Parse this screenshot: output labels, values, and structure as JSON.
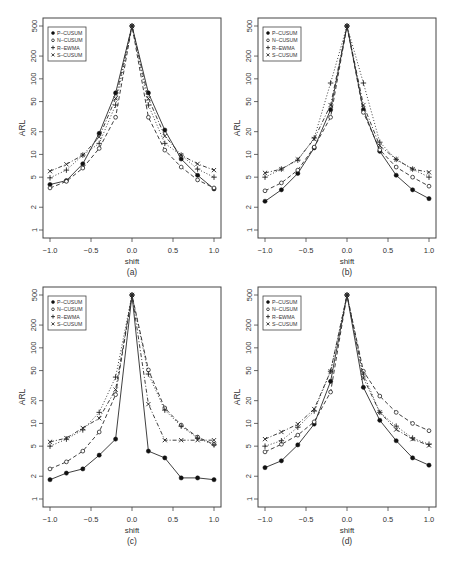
{
  "figure": {
    "x_ticks": [
      "-1.0",
      "-0.5",
      "0.0",
      "0.5",
      "1.0"
    ],
    "y_ticks": [
      "1",
      "2",
      "5",
      "10",
      "20",
      "50",
      "100",
      "200",
      "500"
    ],
    "xlabel": "shift",
    "ylabel": "ARL"
  },
  "legend": [
    {
      "name": "P-CUSUM",
      "marker": "filled-circle",
      "line": "solid"
    },
    {
      "name": "N-CUSUM",
      "marker": "open-circle",
      "line": "dashed"
    },
    {
      "name": "R-EWMA",
      "marker": "plus",
      "line": "dotted"
    },
    {
      "name": "S-CUSUM",
      "marker": "cross",
      "line": "dotdash"
    }
  ],
  "chart_data": [
    {
      "type": "line",
      "panel": "(a)",
      "xlabel": "shift",
      "ylabel": "ARL",
      "yscale": "log",
      "ylim": [
        1,
        500
      ],
      "xlim": [
        -1.0,
        1.0
      ],
      "grid": false,
      "legend_position": "top-left",
      "x": [
        -1.0,
        -0.8,
        -0.6,
        -0.4,
        -0.2,
        0.0,
        0.2,
        0.4,
        0.6,
        0.8,
        1.0
      ],
      "series": [
        {
          "name": "P-CUSUM",
          "values": [
            4.0,
            4.5,
            7.5,
            19,
            65,
            500,
            65,
            21,
            8.7,
            5.3,
            3.5
          ]
        },
        {
          "name": "N-CUSUM",
          "values": [
            3.6,
            4.4,
            6.6,
            12,
            31,
            500,
            31,
            11.4,
            6.8,
            4.6,
            3.6
          ]
        },
        {
          "name": "R-EWMA",
          "values": [
            4.9,
            6.2,
            9.8,
            14,
            45,
            500,
            45,
            14,
            9.8,
            6.4,
            5.0
          ]
        },
        {
          "name": "S-CUSUM",
          "values": [
            6.0,
            7.4,
            9.8,
            17,
            55,
            500,
            55,
            17.5,
            9.8,
            7.5,
            6.2
          ]
        }
      ]
    },
    {
      "type": "line",
      "panel": "(b)",
      "xlabel": "shift",
      "ylabel": "ARL",
      "yscale": "log",
      "ylim": [
        1,
        500
      ],
      "xlim": [
        -1.0,
        1.0
      ],
      "grid": false,
      "legend_position": "top-left",
      "x": [
        -1.0,
        -0.8,
        -0.6,
        -0.4,
        -0.2,
        0.0,
        0.2,
        0.4,
        0.6,
        0.8,
        1.0
      ],
      "series": [
        {
          "name": "P-CUSUM",
          "values": [
            2.4,
            3.4,
            5.6,
            12.2,
            39,
            500,
            39,
            11,
            5.3,
            3.4,
            2.6
          ]
        },
        {
          "name": "N-CUSUM",
          "values": [
            3.3,
            4.2,
            6.2,
            12.5,
            31,
            500,
            36,
            11.5,
            6.8,
            5.0,
            3.8
          ]
        },
        {
          "name": "R-EWMA",
          "values": [
            5.0,
            6.4,
            8.4,
            16.5,
            88,
            500,
            88,
            14.5,
            8.6,
            6.4,
            5.0
          ]
        },
        {
          "name": "S-CUSUM",
          "values": [
            5.7,
            6.4,
            8.6,
            16,
            45,
            500,
            45,
            13,
            8.6,
            6.4,
            5.8
          ]
        }
      ]
    },
    {
      "type": "line",
      "panel": "(c)",
      "xlabel": "shift",
      "ylabel": "ARL",
      "yscale": "log",
      "ylim": [
        1,
        500
      ],
      "xlim": [
        -1.0,
        1.0
      ],
      "grid": false,
      "legend_position": "top-left",
      "x": [
        -1.0,
        -0.8,
        -0.6,
        -0.4,
        -0.2,
        0.0,
        0.2,
        0.4,
        0.6,
        0.8,
        1.0
      ],
      "series": [
        {
          "name": "P-CUSUM",
          "values": [
            1.8,
            2.2,
            2.5,
            3.8,
            6.2,
            500,
            4.3,
            3.5,
            1.9,
            1.9,
            1.8
          ]
        },
        {
          "name": "N-CUSUM",
          "values": [
            2.5,
            3.1,
            4.3,
            7.7,
            24,
            500,
            51,
            16,
            9.5,
            6.6,
            5.3
          ]
        },
        {
          "name": "R-EWMA",
          "values": [
            5.0,
            6.2,
            8.2,
            14,
            41,
            500,
            45,
            15,
            9.2,
            6.4,
            5.2
          ]
        },
        {
          "name": "S-CUSUM",
          "values": [
            5.7,
            6.4,
            8.7,
            11.7,
            28,
            500,
            18,
            6.0,
            6.0,
            6.0,
            6.0
          ]
        }
      ]
    },
    {
      "type": "line",
      "panel": "(d)",
      "xlabel": "shift",
      "ylabel": "ARL",
      "yscale": "log",
      "ylim": [
        1,
        500
      ],
      "xlim": [
        -1.0,
        1.0
      ],
      "grid": false,
      "legend_position": "top-left",
      "x": [
        -1.0,
        -0.8,
        -0.6,
        -0.4,
        -0.2,
        0.0,
        0.2,
        0.4,
        0.6,
        0.8,
        1.0
      ],
      "series": [
        {
          "name": "P-CUSUM",
          "values": [
            2.6,
            3.2,
            5.2,
            9.8,
            36,
            500,
            30,
            11,
            5.9,
            3.5,
            2.8
          ]
        },
        {
          "name": "N-CUSUM",
          "values": [
            4.2,
            5.3,
            7.0,
            10.5,
            26,
            500,
            49,
            23,
            14,
            10,
            8.0
          ]
        },
        {
          "name": "R-EWMA",
          "values": [
            5.0,
            5.9,
            8.9,
            14.6,
            49,
            500,
            45,
            14,
            9.2,
            6.4,
            5.3
          ]
        },
        {
          "name": "S-CUSUM",
          "values": [
            6.2,
            7.7,
            9.8,
            15.5,
            49,
            500,
            40,
            14,
            8.3,
            6.2,
            5.1
          ]
        }
      ]
    }
  ]
}
